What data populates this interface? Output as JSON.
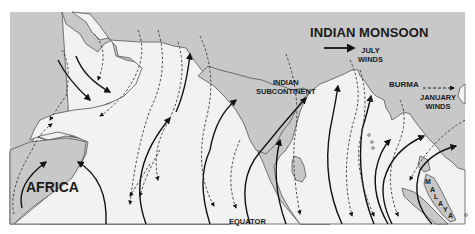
{
  "map": {
    "title": "INDIAN MONSOON",
    "legend": {
      "july": {
        "label_line1": "JULY",
        "label_line2": "WINDS",
        "style": "solid-arrow"
      },
      "january": {
        "label_line1": "JANUARY",
        "label_line2": "WINDS",
        "style": "dashed-arrow"
      }
    },
    "regions": {
      "africa": "AFRICA",
      "indian_subcontinent_line1": "INDIAN",
      "indian_subcontinent_line2": "SUBCONTINENT",
      "burma": "BURMA",
      "malaya": [
        "M",
        "A",
        "L",
        "A",
        "Y",
        "A"
      ]
    },
    "reference_lines": {
      "equator": "EQUATOR"
    },
    "colors": {
      "land": "#c8c8c8",
      "sea": "#f2f2f2",
      "coast": "#555555",
      "arrow": "#111111",
      "page": "#ffffff"
    }
  }
}
